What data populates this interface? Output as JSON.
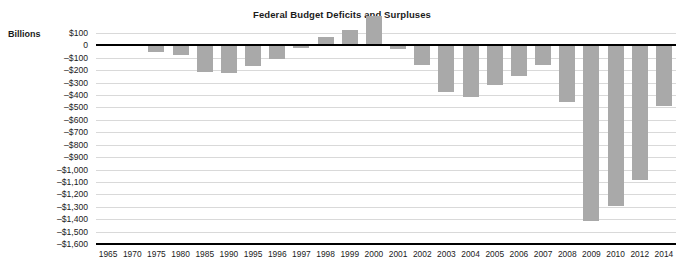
{
  "chart_data": {
    "type": "bar",
    "title": "Federal Budget Deficits and Surpluses",
    "units_label": "Billions",
    "xlabel": "",
    "ylabel": "",
    "grid": true,
    "legend": false,
    "bar_color": "#a9a9a9",
    "zero_line_color": "#000000",
    "gridline_color": "#d9d9d9",
    "ylim": [
      -1600,
      100
    ],
    "ytick_values": [
      100,
      0,
      -100,
      -200,
      -300,
      -400,
      -500,
      -600,
      -700,
      -800,
      -900,
      -1000,
      -1100,
      -1200,
      -1300,
      -1400,
      -1500,
      -1600
    ],
    "ytick_labels": [
      "$100",
      "0",
      "–$100",
      "–$200",
      "–$300",
      "–$400",
      "–$500",
      "–$600",
      "–$700",
      "–$800",
      "–$900",
      "–$1,000",
      "–$1,100",
      "–$1,200",
      "–$1,300",
      "–$1,400",
      "–$1,500",
      "–$1,600"
    ],
    "categories": [
      "1965",
      "1970",
      "1975",
      "1980",
      "1985",
      "1990",
      "1995",
      "1996",
      "1997",
      "1998",
      "1999",
      "2000",
      "2001",
      "2002",
      "2003",
      "2004",
      "2005",
      "2006",
      "2007",
      "2008",
      "2009",
      "2010",
      "2012",
      "2014"
    ],
    "values": [
      -2,
      -3,
      -53,
      -74,
      -212,
      -221,
      -164,
      -107,
      -22,
      69,
      125,
      236,
      -32,
      -158,
      -378,
      -413,
      -318,
      -248,
      -161,
      -459,
      -1413,
      -1294,
      -1087,
      -485
    ]
  }
}
